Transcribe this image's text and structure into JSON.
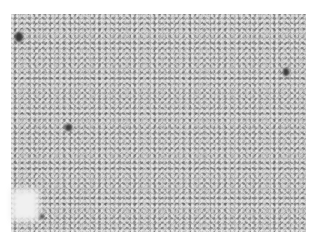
{
  "image": {
    "subject": "grayscale histology micrograph of densely packed spindle-cell tissue",
    "colors": {
      "background": "#ffffff",
      "tissue_mid": "#b8b8b8",
      "dark_nuclei": "#3a3a3a",
      "pale_area": "#f0f0f0"
    },
    "features": [
      {
        "name": "dark-spot-top-left",
        "x": 18,
        "y": 36
      },
      {
        "name": "dark-spot-center",
        "x": 68,
        "y": 128
      },
      {
        "name": "dark-spot-right",
        "x": 284,
        "y": 70
      },
      {
        "name": "dark-spot-bottom-left",
        "x": 20,
        "y": 198
      },
      {
        "name": "pale-area-bottom-left",
        "x": 20,
        "y": 205
      }
    ]
  }
}
